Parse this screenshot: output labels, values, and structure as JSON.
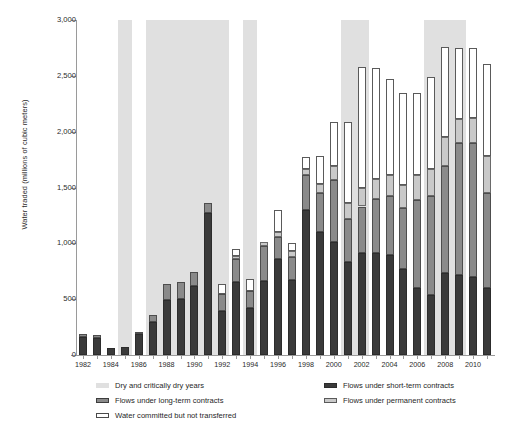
{
  "chart_data": {
    "type": "bar",
    "stacked": true,
    "title": "",
    "xlabel": "",
    "ylabel": "Water traded (millions of cubic meters)",
    "ylim": [
      0,
      3000
    ],
    "yticks": [
      0,
      500,
      1000,
      1500,
      2000,
      2500,
      3000
    ],
    "ytick_labels": [
      "0",
      "500",
      "1,000",
      "1,500",
      "2,000",
      "2,500",
      "3,000"
    ],
    "grid": false,
    "legend_position": "below",
    "categories": [
      "1982",
      "1983",
      "1984",
      "1985",
      "1986",
      "1987",
      "1988",
      "1989",
      "1990",
      "1991",
      "1992",
      "1993",
      "1994",
      "1995",
      "1996",
      "1997",
      "1998",
      "1999",
      "2000",
      "2001",
      "2002",
      "2003",
      "2004",
      "2005",
      "2006",
      "2007",
      "2008",
      "2009",
      "2010",
      "2011"
    ],
    "xtick_labels": [
      "1982",
      "1984",
      "1986",
      "1988",
      "1990",
      "1992",
      "1994",
      "1996",
      "1998",
      "2000",
      "2002",
      "2004",
      "2006",
      "2008",
      "2010"
    ],
    "series": [
      {
        "name": "Flows under short-term contracts",
        "color": "#3a3a3a",
        "values": [
          160,
          150,
          60,
          70,
          185,
          300,
          490,
          500,
          620,
          1270,
          390,
          650,
          420,
          660,
          860,
          670,
          1300,
          1100,
          1010,
          830,
          910,
          910,
          900,
          770,
          600,
          540,
          730,
          720,
          700,
          600
        ]
      },
      {
        "name": "Flows under long-term contracts",
        "color": "#8a8a8a",
        "values": [
          25,
          25,
          0,
          0,
          25,
          55,
          150,
          155,
          120,
          90,
          155,
          210,
          150,
          320,
          200,
          210,
          310,
          350,
          560,
          390,
          420,
          490,
          520,
          550,
          790,
          880,
          960,
          1180,
          1200,
          850
        ]
      },
      {
        "name": "Flows under permanent contracts",
        "color": "#c9c9c9",
        "values": [
          0,
          0,
          0,
          0,
          0,
          0,
          0,
          0,
          0,
          0,
          0,
          30,
          0,
          30,
          40,
          50,
          60,
          80,
          120,
          140,
          170,
          180,
          190,
          200,
          220,
          250,
          260,
          210,
          220,
          330
        ]
      },
      {
        "name": "Water committed but not transferred",
        "color": "#ffffff",
        "values": [
          0,
          0,
          0,
          0,
          0,
          0,
          0,
          0,
          0,
          0,
          90,
          60,
          110,
          0,
          200,
          70,
          100,
          250,
          400,
          730,
          1080,
          990,
          860,
          830,
          740,
          820,
          810,
          640,
          630,
          830
        ]
      }
    ],
    "shaded_bands": {
      "label": "Dry and critically dry years",
      "color": "#e0e0e0",
      "ranges": [
        {
          "start": "1985",
          "end": "1985"
        },
        {
          "start": "1987",
          "end": "1992"
        },
        {
          "start": "1994",
          "end": "1994"
        },
        {
          "start": "2001",
          "end": "2002"
        },
        {
          "start": "2007",
          "end": "2009"
        }
      ]
    }
  },
  "legend": {
    "items": [
      {
        "label": "Dry and critically dry years",
        "swatch": "sw-dry"
      },
      {
        "label": "Flows under short-term contracts",
        "swatch": "sw-short"
      },
      {
        "label": "Flows under long-term contracts",
        "swatch": "sw-long"
      },
      {
        "label": "Flows under permanent contracts",
        "swatch": "sw-perm"
      },
      {
        "label": "Water committed but not transferred",
        "swatch": "sw-comm"
      }
    ]
  }
}
